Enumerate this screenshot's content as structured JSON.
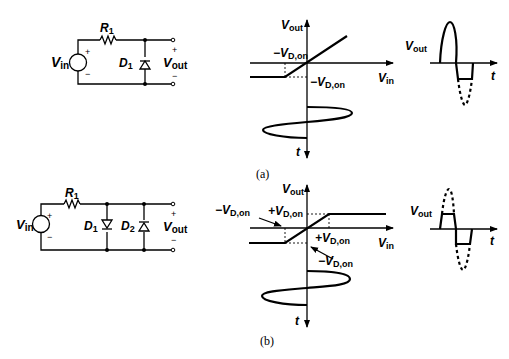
{
  "figure": {
    "panels": [
      {
        "caption": "(a)",
        "circuit": {
          "source": {
            "label": "V",
            "sub": "in",
            "plus": "+",
            "minus": "−"
          },
          "resistor": {
            "label": "R",
            "sub": "1"
          },
          "diodes": [
            {
              "label": "D",
              "sub": "1",
              "orientation": "anode-bottom"
            }
          ],
          "output": {
            "label": "V",
            "sub": "out",
            "plus": "+",
            "minus": "−"
          }
        },
        "transfer": {
          "y_axis": {
            "label": "V",
            "sub": "out"
          },
          "x_axis": {
            "label": "V",
            "sub": "in"
          },
          "annotations": [
            {
              "text": "−V",
              "sub": "D,on",
              "role": "breakpoint-x"
            },
            {
              "text": "−V",
              "sub": "D,on",
              "role": "clamp-level-y"
            }
          ],
          "input_waveform_axis": {
            "label": "t"
          }
        },
        "output_waveform": {
          "y_label": {
            "text": "V",
            "sub": "out"
          },
          "x_label": "t",
          "description": "positive half passes, negative half clipped at −V_D,on (dashed = original)"
        }
      },
      {
        "caption": "(b)",
        "circuit": {
          "source": {
            "label": "V",
            "sub": "in",
            "plus": "+",
            "minus": "−"
          },
          "resistor": {
            "label": "R",
            "sub": "1"
          },
          "diodes": [
            {
              "label": "D",
              "sub": "1",
              "orientation": "anode-top"
            },
            {
              "label": "D",
              "sub": "2",
              "orientation": "anode-bottom"
            }
          ],
          "output": {
            "label": "V",
            "sub": "out",
            "plus": "+",
            "minus": "−"
          }
        },
        "transfer": {
          "y_axis": {
            "label": "V",
            "sub": "out"
          },
          "x_axis": {
            "label": "V",
            "sub": "in"
          },
          "annotations": [
            {
              "text": "−V",
              "sub": "D,on",
              "role": "breakpoint-x-negative"
            },
            {
              "text": "+V",
              "sub": "D,on",
              "role": "clamp-level-y-positive"
            },
            {
              "text": "+V",
              "sub": "D,on",
              "role": "breakpoint-x-positive"
            },
            {
              "text": "−V",
              "sub": "D,on",
              "role": "clamp-level-y-negative"
            }
          ],
          "input_waveform_axis": {
            "label": "t"
          }
        },
        "output_waveform": {
          "y_label": {
            "text": "V",
            "sub": "out"
          },
          "x_label": "t",
          "description": "both halves clipped at ±V_D,on (dashed = original)"
        }
      }
    ]
  }
}
